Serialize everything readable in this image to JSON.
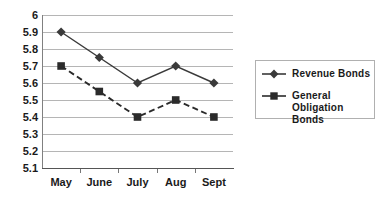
{
  "chart_data": {
    "type": "line",
    "title": "",
    "xlabel": "",
    "ylabel": "",
    "categories": [
      "May",
      "June",
      "July",
      "Aug",
      "Sept"
    ],
    "series": [
      {
        "name": "Revenue Bonds",
        "values": [
          5.9,
          5.75,
          5.6,
          5.7,
          5.6
        ],
        "marker": "diamond",
        "line_style": "solid",
        "color": "#3a3a3a"
      },
      {
        "name": "General Obligation Bonds",
        "values": [
          5.7,
          5.55,
          5.4,
          5.5,
          5.4
        ],
        "marker": "square",
        "line_style": "dashed",
        "color": "#2b2b2b"
      }
    ],
    "ylim": [
      5.1,
      6.0
    ],
    "ytick_labels": [
      "6",
      "5.9",
      "5.8",
      "5.7",
      "5.6",
      "5.5",
      "5.4",
      "5.3",
      "5.2",
      "5.1"
    ],
    "ytick_values": [
      6.0,
      5.9,
      5.8,
      5.7,
      5.6,
      5.5,
      5.4,
      5.3,
      5.2,
      5.1
    ],
    "grid": true,
    "legend_position": "right",
    "colors": {
      "gridline": "#b5b5b5",
      "axis": "#555555",
      "text": "#1a1a1a",
      "legend_border": "#b0b0b0",
      "background": "#ffffff"
    }
  },
  "legend": {
    "entries": [
      {
        "label": "Revenue Bonds",
        "label_line2": ""
      },
      {
        "label": "General",
        "label_line2": "Obligation Bonds"
      }
    ]
  }
}
